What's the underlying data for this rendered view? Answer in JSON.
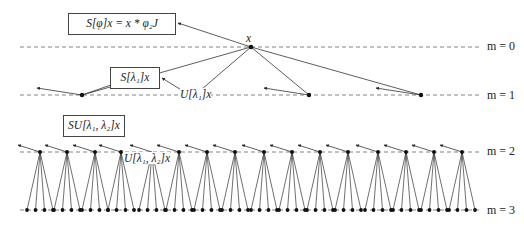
{
  "diagram": {
    "type": "scattering-tree",
    "root_label": "x",
    "boxes": {
      "root_output": "S[φ]x = x * φ₂J",
      "level1_output": "S[λ₁]x",
      "level2_output": "SU[λ₁, λ₂]x"
    },
    "node_labels": {
      "level1": "U[λ₁]x",
      "level2": "U[λ₁, λ₂]x"
    },
    "levels": [
      {
        "label": "m = 0",
        "y": 47
      },
      {
        "label": "m = 1",
        "y": 95
      },
      {
        "label": "m = 2",
        "y": 152
      },
      {
        "label": "m = 3",
        "y": 210
      }
    ],
    "nodes": {
      "level0": [
        251
      ],
      "level1": [
        82,
        195,
        309,
        421
      ],
      "level2": [
        40,
        67,
        95,
        121,
        152,
        179,
        207,
        235,
        264,
        292,
        320,
        348,
        378,
        406,
        434,
        462
      ],
      "children_per_node": 4
    },
    "colors": {
      "line": "#333333",
      "dash": "#666666",
      "node": "#111111",
      "box_border": "#444444"
    }
  }
}
